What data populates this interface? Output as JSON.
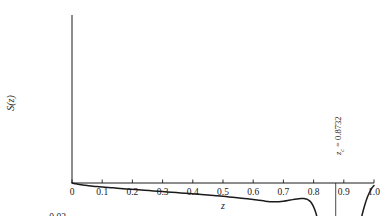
{
  "chart_data": {
    "type": "line",
    "title": "",
    "xlabel": "z",
    "ylabel": "S(z)",
    "xlim": [
      0,
      1.0
    ],
    "ylim": [
      0,
      -0.1
    ],
    "grid": false,
    "legend": false,
    "x_ticks": [
      "0",
      "0.1",
      "0.2",
      "0.3",
      "0.4",
      "0.5",
      "0.6",
      "0.7",
      "0.8",
      "0.9",
      "1.0"
    ],
    "x_tick_values": [
      0,
      0.1,
      0.2,
      0.3,
      0.4,
      0.5,
      0.6,
      0.7,
      0.8,
      0.9,
      1.0
    ],
    "y_ticks": [
      "-0.02",
      "-0.04",
      "-0.06",
      "-0.08",
      "-0.10"
    ],
    "y_tick_values": [
      -0.02,
      -0.04,
      -0.06,
      -0.08,
      -0.1
    ],
    "y_axis_inverted": true,
    "series": [
      {
        "name": "S(z)",
        "color": "#1a1a1a",
        "x": [
          0.0,
          0.01,
          0.02,
          0.03,
          0.04,
          0.05,
          0.07,
          0.09,
          0.11,
          0.13,
          0.15,
          0.18,
          0.21,
          0.24,
          0.27,
          0.3,
          0.33,
          0.36,
          0.39,
          0.42,
          0.45,
          0.48,
          0.51,
          0.54,
          0.57,
          0.6,
          0.62,
          0.64,
          0.655,
          0.665,
          0.675,
          0.685,
          0.7,
          0.715,
          0.73,
          0.745,
          0.758,
          0.768,
          0.775,
          0.782,
          0.79,
          0.798,
          0.806,
          0.814,
          0.822,
          0.83,
          0.838,
          0.846,
          0.854,
          0.862,
          0.868,
          0.8732,
          0.878,
          0.884,
          0.89,
          0.898,
          0.906,
          0.914,
          0.922,
          0.93,
          0.938,
          0.946,
          0.954,
          0.962,
          0.97,
          0.978,
          0.986,
          0.993,
          1.0
        ],
        "y": [
          0.0,
          -0.0004,
          -0.0008,
          -0.0011,
          -0.0013,
          -0.0015,
          -0.0019,
          -0.0022,
          -0.0025,
          -0.0028,
          -0.0031,
          -0.0035,
          -0.0039,
          -0.0043,
          -0.0047,
          -0.0051,
          -0.0055,
          -0.0059,
          -0.0063,
          -0.0067,
          -0.0071,
          -0.0076,
          -0.0081,
          -0.0086,
          -0.0092,
          -0.0098,
          -0.0103,
          -0.0108,
          -0.0111,
          -0.0112,
          -0.0112,
          -0.0111,
          -0.0108,
          -0.0104,
          -0.0099,
          -0.0095,
          -0.0093,
          -0.0093,
          -0.0095,
          -0.01,
          -0.0112,
          -0.0135,
          -0.017,
          -0.0222,
          -0.0292,
          -0.038,
          -0.0478,
          -0.0578,
          -0.0672,
          -0.076,
          -0.0805,
          -0.083,
          -0.0835,
          -0.083,
          -0.0812,
          -0.0772,
          -0.0715,
          -0.0645,
          -0.0565,
          -0.048,
          -0.0395,
          -0.0315,
          -0.0243,
          -0.018,
          -0.0128,
          -0.0085,
          -0.0052,
          -0.003,
          -0.0015
        ]
      }
    ],
    "annotations": [
      {
        "name": "critical-point-marker",
        "label": "z_c = 0.8732",
        "label_prefix": "z",
        "label_subscript": "c",
        "label_rest": " = 0.8732",
        "x": 0.8732,
        "orientation": "vertical",
        "line_from_y": -0.0975,
        "line_to_y": 0.0
      }
    ]
  }
}
